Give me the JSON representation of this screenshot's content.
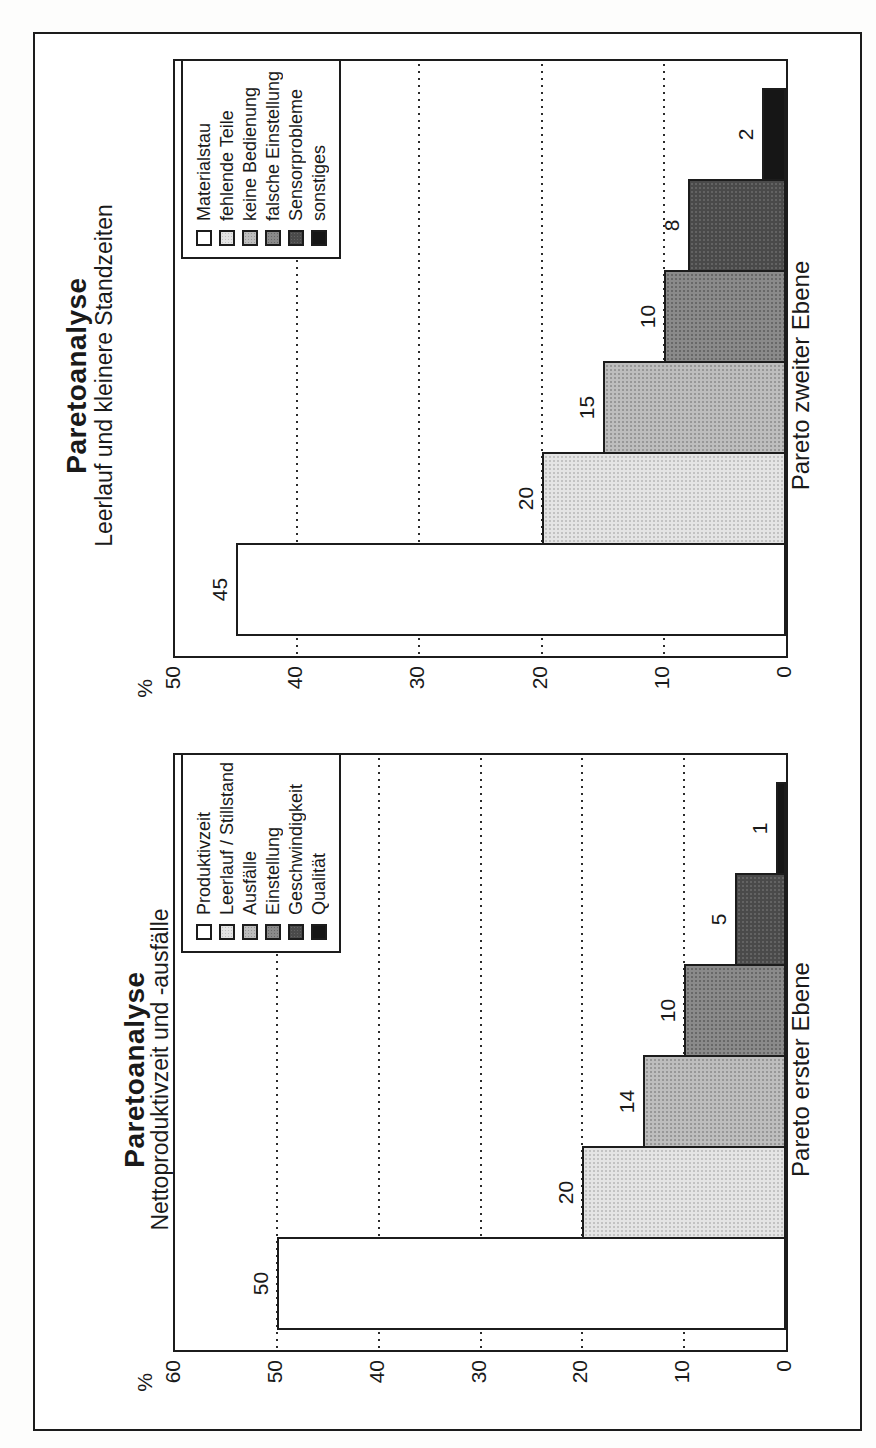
{
  "page": {
    "frame_color": "#1c1c1c",
    "background": "#ffffff",
    "text_color": "#1a1a1a"
  },
  "style": {
    "bar_fills": [
      "#ffffff",
      "#e4e4e4",
      "#bdbdbd",
      "#8a8a8a",
      "#4a4a4a",
      "#161616"
    ],
    "bar_dot_colors": [
      null,
      "#c2c2c2",
      "#979797",
      "#686868",
      "#636363",
      null
    ],
    "line_color": "#1c1c1c",
    "grid_style": "dotted"
  },
  "chart_data": [
    {
      "type": "bar",
      "page_slot": "top-half, rotated 90deg CCW",
      "title": "Paretoanalyse",
      "subtitle": "Leerlauf und kleinere Standzeiten",
      "xlabel": "Pareto zweiter Ebene",
      "ylabel": "%",
      "ylim": [
        0,
        50
      ],
      "yticks": [
        50,
        40,
        30,
        20,
        10,
        0
      ],
      "gridlines": [
        40,
        30,
        20,
        10
      ],
      "legend_position": "top-right",
      "categories": [
        "Materialstau",
        "fehlende Teile",
        "keine Bedienung",
        "falsche Einstellung",
        "Sensorprobleme",
        "sonstiges"
      ],
      "values": [
        45,
        20,
        15,
        10,
        8,
        2
      ],
      "value_labels": [
        "45",
        "20",
        "15",
        "10",
        "8",
        "2"
      ],
      "title_top": 26,
      "subtitle_top": 56
    },
    {
      "type": "bar",
      "page_slot": "bottom-half, rotated 90deg CCW",
      "title": "Paretoanalyse",
      "subtitle": "Nettoproduktivzeit und -ausfälle",
      "xlabel": "Pareto erster Ebene",
      "ylabel": "%",
      "ylim": [
        0,
        60
      ],
      "yticks": [
        60,
        50,
        40,
        30,
        20,
        10,
        0
      ],
      "gridlines": [
        50,
        40,
        30,
        20,
        10
      ],
      "legend_position": "top-right",
      "categories": [
        "Produktivzeit",
        "Leerlauf / Stillstand",
        "Ausfälle",
        "Einstellung",
        "Geschwindigkeit",
        "Qualität"
      ],
      "values": [
        50,
        20,
        14,
        10,
        5,
        1
      ],
      "value_labels": [
        "50",
        "20",
        "14",
        "10",
        "5",
        "1"
      ],
      "title_top": 84,
      "subtitle_top": 112
    }
  ]
}
